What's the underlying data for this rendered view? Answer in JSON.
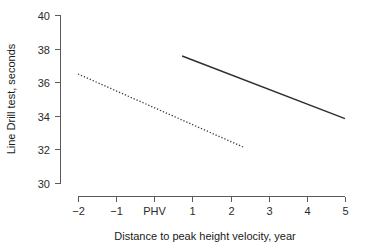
{
  "chart_data": {
    "type": "line",
    "title": "",
    "subtitle": "",
    "xlabel": "Distance to peak height velocity, year",
    "ylabel": "Line Drill test, seconds",
    "xlim": [
      -2.3,
      5.2
    ],
    "ylim": [
      29.4,
      40.3
    ],
    "grid": false,
    "legend": "none",
    "x_ticks": [
      {
        "value": -2,
        "label": "−2"
      },
      {
        "value": -1,
        "label": "−1"
      },
      {
        "value": 0,
        "label": "PHV"
      },
      {
        "value": 1,
        "label": "1"
      },
      {
        "value": 2,
        "label": "2"
      },
      {
        "value": 3,
        "label": "3"
      },
      {
        "value": 4,
        "label": "4"
      },
      {
        "value": 5,
        "label": "5"
      }
    ],
    "y_ticks": [
      {
        "value": 30,
        "label": "30"
      },
      {
        "value": 32,
        "label": "32"
      },
      {
        "value": 34,
        "label": "34"
      },
      {
        "value": 36,
        "label": "36"
      },
      {
        "value": 38,
        "label": "38"
      },
      {
        "value": 40,
        "label": "40"
      }
    ],
    "series": [
      {
        "name": "post-PHV trajectory",
        "style": "solid",
        "color": "#2e2e2e",
        "x": [
          0.73,
          5.0
        ],
        "values": [
          37.56,
          33.83
        ]
      },
      {
        "name": "pre-PHV trajectory",
        "style": "dotted",
        "color": "#3a3a3a",
        "x": [
          -2.0,
          2.33
        ],
        "values": [
          36.49,
          32.14
        ]
      }
    ]
  },
  "axes": {
    "x_title": "Distance to peak height velocity, year",
    "y_title": "Line Drill test, seconds"
  }
}
